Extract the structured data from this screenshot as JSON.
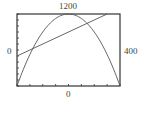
{
  "labels": {
    "ymax": "1200",
    "xmin": "0",
    "xmax": "400",
    "ymin": "0"
  },
  "chart_data": {
    "type": "line",
    "title": "",
    "xlabel": "",
    "ylabel": "",
    "xlim": [
      0,
      400
    ],
    "ylim": [
      0,
      1200
    ],
    "grid": false,
    "window_labels": {
      "top": "1200",
      "left": "0",
      "right": "400",
      "bottom": "0"
    },
    "x_ticks_every": 50,
    "y_ticks_every": 100,
    "series": [
      {
        "name": "parabola",
        "equation": "y = 12x - 0.03x^2",
        "x": [
          0,
          50,
          100,
          150,
          200,
          250,
          300,
          350,
          400
        ],
        "y": [
          0,
          525,
          900,
          1125,
          1200,
          1125,
          900,
          525,
          0
        ]
      },
      {
        "name": "line",
        "equation": "y = 2x + 500",
        "x": [
          0,
          350
        ],
        "y": [
          500,
          1200
        ]
      }
    ]
  }
}
